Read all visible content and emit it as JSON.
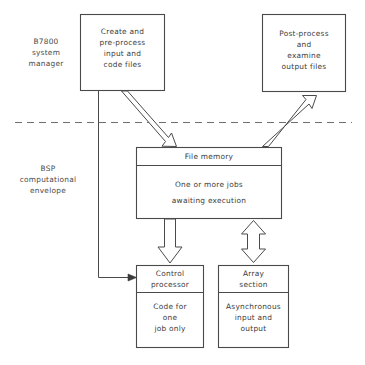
{
  "diagram": {
    "line_color": "#4a4a4a",
    "text_color": "#3b3b3b",
    "background": "#ffffff",
    "divider_label": "dashed-boundary-line"
  },
  "side_labels": {
    "top": "B7800\nsystem\nmanager",
    "bottom": "BSP\ncomputational\nenvelope"
  },
  "boxes": {
    "create": {
      "name": "create-and-preprocess-box",
      "text": "Create and\npre-process\ninput and\ncode files"
    },
    "postprocess": {
      "name": "post-process-box",
      "text": "Post-process\nand\nexamine\noutput files"
    },
    "file_memory": {
      "name": "file-memory-box",
      "header": "File memory",
      "body": "One or more jobs\nawaiting execution"
    },
    "control_processor": {
      "name": "control-processor-box",
      "header": "Control\nprocessor",
      "body": "Code for\none\njob only"
    },
    "array_section": {
      "name": "array-section-box",
      "header": "Array\nsection",
      "body": "Asynchronous\ninput and\noutput"
    }
  },
  "connectors": {
    "create_to_file_memory": "double-line-arrow-down-right",
    "file_memory_to_postprocess": "double-line-arrow-up-right",
    "file_memory_to_control_processor": "hollow-arrow-down",
    "file_memory_to_array_section": "hollow-arrow-bidirectional",
    "create_to_control_processor": "thin-line-arrow-right"
  }
}
